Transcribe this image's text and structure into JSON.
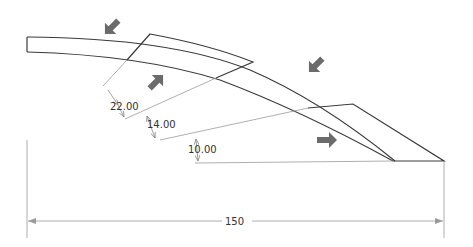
{
  "drawing": {
    "type": "technical-drawing",
    "description": "Curved strip with three angled panels and force arrows",
    "line_color": "#3a3a3a",
    "dim_line_color": "#8a8a8a",
    "arrow_color": "#6b6b6b"
  },
  "dimensions": {
    "d1": "22.00",
    "d2": "14.00",
    "d3": "10.00",
    "overall_width": "150"
  },
  "arrows": [
    {
      "name": "force-arrow-top-left",
      "direction": "down-left"
    },
    {
      "name": "force-arrow-mid-left",
      "direction": "up-right"
    },
    {
      "name": "force-arrow-top-right",
      "direction": "down-left"
    },
    {
      "name": "force-arrow-right",
      "direction": "right"
    }
  ]
}
